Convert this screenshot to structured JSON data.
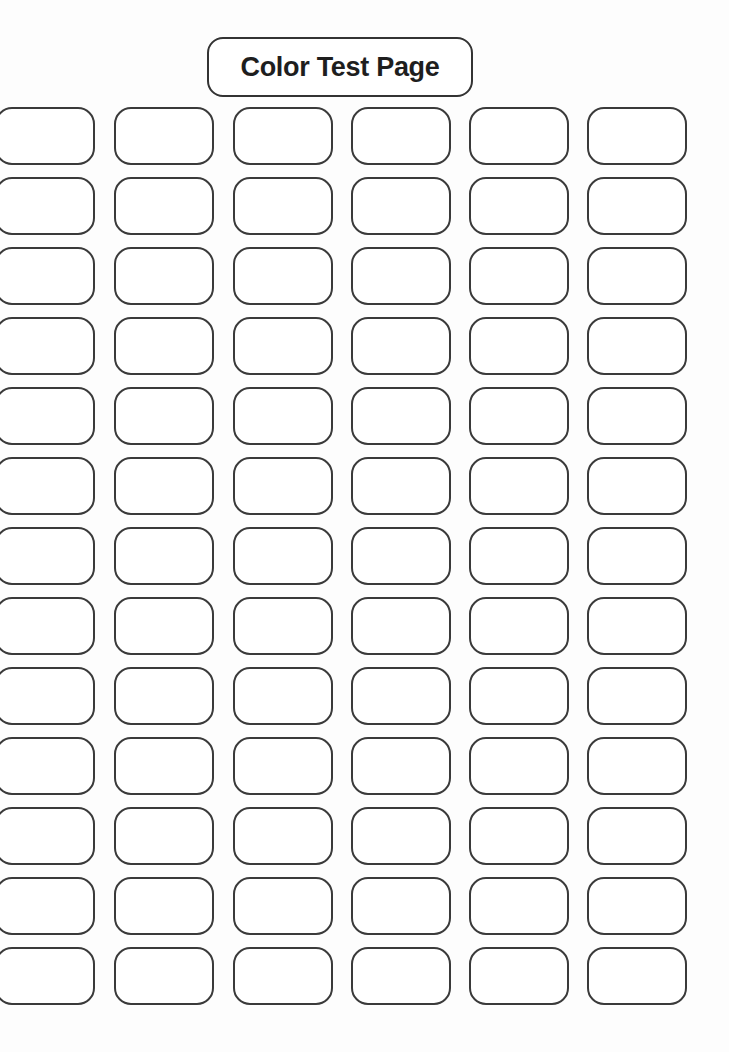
{
  "page": {
    "title": "Color Test Page"
  },
  "grid": {
    "columns": 6,
    "rows": 13,
    "column_x": [
      -5,
      114,
      233,
      351,
      469,
      587
    ],
    "row_start_y": 107,
    "row_pitch": 70,
    "swatch_width": 100,
    "swatch_height": 58,
    "swatch_fill": "#ffffff",
    "swatch_border": "#3a3a3a"
  }
}
